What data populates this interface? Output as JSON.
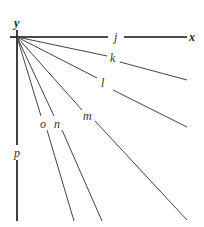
{
  "diagram": {
    "origin": [
      17,
      37
    ],
    "axes": {
      "x": {
        "label": "x",
        "end": [
          187,
          37
        ]
      },
      "y": {
        "label": "y",
        "end": [
          17,
          221
        ]
      }
    },
    "rays": [
      {
        "label": "j",
        "end": [
          187,
          37
        ]
      },
      {
        "label": "k",
        "end": [
          187,
          80
        ]
      },
      {
        "label": "l",
        "end": [
          187,
          127
        ]
      },
      {
        "label": "m",
        "end": [
          187,
          220
        ]
      },
      {
        "label": "n",
        "end": [
          102,
          221
        ]
      },
      {
        "label": "o",
        "end": [
          74,
          221
        ]
      },
      {
        "label": "p",
        "end": [
          17,
          221
        ]
      }
    ],
    "colors": {
      "axis": "#111111",
      "ray": "#444444",
      "label": "#333333"
    }
  }
}
